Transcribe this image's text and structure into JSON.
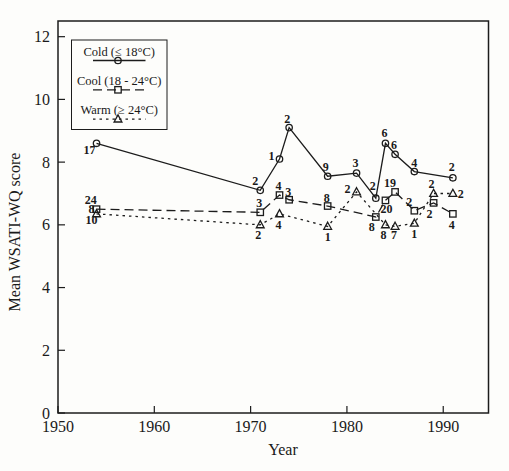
{
  "figure": {
    "x_axis_title": "Year",
    "y_axis_title": "Mean WSATI-WQ score"
  },
  "chart_data": {
    "type": "line",
    "title": "",
    "xlabel": "Year",
    "ylabel": "Mean WSATI-WQ score",
    "xlim": [
      1950,
      1994.7
    ],
    "ylim": [
      0,
      12.5
    ],
    "x_ticks": [
      1950,
      1960,
      1970,
      1980,
      1990
    ],
    "y_ticks": [
      0,
      2,
      4,
      6,
      8,
      10,
      12
    ],
    "grid": false,
    "legend_position": "top-left-inside",
    "ink_color": "#1c1c1c",
    "series": [
      {
        "name": "Cold (≤ 18°C)",
        "marker": "circle",
        "line_style": "solid",
        "points": [
          {
            "x": 1954,
            "y": 8.6,
            "n": "17",
            "dx": -7,
            "dy": 7
          },
          {
            "x": 1971,
            "y": 7.1,
            "n": "2",
            "dx": -5,
            "dy": -9
          },
          {
            "x": 1973,
            "y": 8.1,
            "n": "1",
            "dx": -8,
            "dy": -3
          },
          {
            "x": 1974,
            "y": 9.1,
            "n": "2",
            "dx": -2,
            "dy": -9
          },
          {
            "x": 1978,
            "y": 7.55,
            "n": "9",
            "dx": -2,
            "dy": -9
          },
          {
            "x": 1981,
            "y": 7.65,
            "n": "3",
            "dx": -1,
            "dy": -10
          },
          {
            "x": 1983,
            "y": 6.85,
            "n": "2",
            "dx": -3,
            "dy": -12
          },
          {
            "x": 1984,
            "y": 8.6,
            "n": "6",
            "dx": -1,
            "dy": -10
          },
          {
            "x": 1985,
            "y": 8.25,
            "n": "6",
            "dx": -1,
            "dy": -9
          },
          {
            "x": 1987,
            "y": 7.7,
            "n": "4",
            "dx": 0,
            "dy": -9
          },
          {
            "x": 1991,
            "y": 7.5,
            "n": "2",
            "dx": -1,
            "dy": -11
          }
        ]
      },
      {
        "name": "Cool (18 - 24°C)",
        "marker": "square",
        "line_style": "long-dash",
        "points": [
          {
            "x": 1954,
            "y": 6.5,
            "n": "8",
            "dx": -5,
            "dy": 0
          },
          {
            "x": 1971,
            "y": 6.4,
            "n": "3",
            "dx": -1,
            "dy": -9
          },
          {
            "x": 1973,
            "y": 6.95,
            "n": "4",
            "dx": -1,
            "dy": -9
          },
          {
            "x": 1974,
            "y": 6.8,
            "n": "3",
            "dx": -1,
            "dy": -8
          },
          {
            "x": 1978,
            "y": 6.6,
            "n": "8",
            "dx": -1,
            "dy": -8
          },
          {
            "x": 1983,
            "y": 6.25,
            "n": "8",
            "dx": -4,
            "dy": 10
          },
          {
            "x": 1984,
            "y": 6.78,
            "n": "20",
            "dx": 1,
            "dy": 9
          },
          {
            "x": 1985,
            "y": 7.05,
            "n": "19",
            "dx": -5,
            "dy": -9
          },
          {
            "x": 1987,
            "y": 6.45,
            "n": "2",
            "dx": -5,
            "dy": -9
          },
          {
            "x": 1989,
            "y": 6.7,
            "n": "2",
            "dx": -4,
            "dy": 11
          },
          {
            "x": 1991,
            "y": 6.35,
            "n": "4",
            "dx": -1,
            "dy": 11
          }
        ]
      },
      {
        "name": "Warm (≥ 24°C)",
        "marker": "triangle",
        "line_style": "short-dash",
        "points": [
          {
            "x": 1954,
            "y": 6.35,
            "n": "10",
            "dx": -5,
            "dy": 6
          },
          {
            "x": 1971,
            "y": 6.0,
            "n": "2",
            "dx": -2,
            "dy": 10
          },
          {
            "x": 1973,
            "y": 6.35,
            "n": "4",
            "dx": -1,
            "dy": 11
          },
          {
            "x": 1978,
            "y": 5.95,
            "n": "1",
            "dx": 0,
            "dy": 11
          },
          {
            "x": 1981,
            "y": 7.05,
            "n": "2",
            "dx": -9,
            "dy": -3
          },
          {
            "x": 1984,
            "y": 6.0,
            "n": "8",
            "dx": -2,
            "dy": 10
          },
          {
            "x": 1985,
            "y": 5.95,
            "n": "7",
            "dx": -1,
            "dy": 9
          },
          {
            "x": 1987,
            "y": 6.05,
            "n": "1",
            "dx": 0,
            "dy": 11
          },
          {
            "x": 1989,
            "y": 7.0,
            "n": "2",
            "dx": -2,
            "dy": -9
          },
          {
            "x": 1991,
            "y": 7.0,
            "n": "2",
            "dx": 8,
            "dy": 1
          }
        ]
      }
    ],
    "annotations": [
      {
        "text": "24",
        "x": 1953.4,
        "y": 6.78
      }
    ]
  }
}
